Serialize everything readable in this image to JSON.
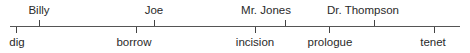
{
  "diagram": {
    "type": "timeline",
    "axis": {
      "x_start": 10,
      "x_end": 460,
      "y": 26,
      "color": "#555555"
    },
    "top_items": [
      {
        "label": "Billy",
        "x": 39,
        "label_x": 39
      },
      {
        "label": "Joe",
        "x": 154,
        "label_x": 154
      },
      {
        "label": "Mr. Jones",
        "x": 285,
        "label_x": 266
      },
      {
        "label": "Dr. Thompson",
        "x": 374,
        "label_x": 363
      }
    ],
    "bottom_items": [
      {
        "label": "dig",
        "x": 16,
        "label_x": 17
      },
      {
        "label": "borrow",
        "x": 136,
        "label_x": 134
      },
      {
        "label": "incision",
        "x": 255,
        "label_x": 255
      },
      {
        "label": "prologue",
        "x": 329,
        "label_x": 330
      },
      {
        "label": "tenet",
        "x": 434,
        "label_x": 433
      }
    ]
  }
}
